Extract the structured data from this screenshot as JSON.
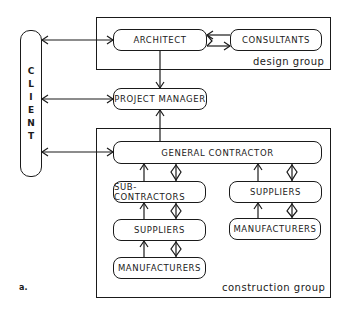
{
  "diagram": {
    "client": {
      "label": "CLIENT",
      "letters": [
        "C",
        "L",
        "I",
        "E",
        "N",
        "T"
      ]
    },
    "design_group": {
      "label": "design group",
      "nodes": {
        "architect": "ARCHITECT",
        "consultants": "CONSULTANTS"
      }
    },
    "project_manager": "PROJECT MANAGER",
    "construction_group": {
      "label": "construction group",
      "nodes": {
        "general_contractor": "GENERAL CONTRACTOR",
        "sub_contractors": "SUB-CONTRACTORS",
        "suppliers_left": "SUPPLIERS",
        "manufacturers_left": "MANUFACTURERS",
        "suppliers_right": "SUPPLIERS",
        "manufacturers_right": "MANUFACTURERS"
      }
    },
    "figure_label": "a.",
    "edges": [
      {
        "from": "CLIENT",
        "to": "ARCHITECT",
        "type": "bidirectional"
      },
      {
        "from": "CLIENT",
        "to": "PROJECT MANAGER",
        "type": "bidirectional"
      },
      {
        "from": "CLIENT",
        "to": "GENERAL CONTRACTOR",
        "type": "bidirectional"
      },
      {
        "from": "ARCHITECT",
        "to": "CONSULTANTS",
        "type": "bidirectional"
      },
      {
        "from": "ARCHITECT",
        "to": "PROJECT MANAGER",
        "type": "directed"
      },
      {
        "from": "GENERAL CONTRACTOR",
        "to": "PROJECT MANAGER",
        "type": "directed"
      },
      {
        "from": "SUB-CONTRACTORS",
        "to": "GENERAL CONTRACTOR",
        "type": "directed+diamond"
      },
      {
        "from": "SUPPLIERS (left)",
        "to": "SUB-CONTRACTORS",
        "type": "directed+diamond"
      },
      {
        "from": "MANUFACTURERS (left)",
        "to": "SUPPLIERS (left)",
        "type": "directed+diamond"
      },
      {
        "from": "SUPPLIERS (right)",
        "to": "GENERAL CONTRACTOR",
        "type": "directed+diamond"
      },
      {
        "from": "MANUFACTURERS (right)",
        "to": "SUPPLIERS (right)",
        "type": "directed+diamond"
      }
    ]
  }
}
